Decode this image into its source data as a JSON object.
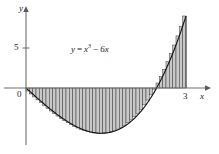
{
  "figure": {
    "title": "",
    "background_color": "#ffffff",
    "width": 219,
    "height": 154
  },
  "axes": {
    "x_axis_label": "x",
    "y_axis_label": "y",
    "origin_label": "0",
    "x_ticks": [
      {
        "value": 3,
        "label": "3"
      }
    ],
    "y_ticks": [
      {
        "value": 5,
        "label": "5"
      }
    ],
    "axis_color": "#6e6e6e",
    "label_color": "#1a1a1a"
  },
  "annotations": {
    "equation": {
      "lhs": "y",
      "equals": "=",
      "base": "x",
      "exponent": "3",
      "minus": "−",
      "term": "6x",
      "plain": "y = x³ − 6x"
    }
  },
  "chart_data": {
    "type": "area",
    "title": "",
    "subtitle": "",
    "xlabel": "x",
    "ylabel": "y",
    "function": "y = x^3 - 6x",
    "xlim": [
      -0.5,
      3.4
    ],
    "ylim": [
      -7.5,
      10.5
    ],
    "grid": false,
    "legend_position": "none",
    "annotations": [
      "y = x³ − 6x"
    ],
    "riemann_sum": {
      "method": "right-endpoint",
      "interval": [
        0,
        3
      ],
      "n_rectangles": 48,
      "fill_color": "#c8c8c8",
      "edge_color": "#222222",
      "signed": true
    },
    "curve_color": "#111111",
    "roots_shown": [
      0,
      2.449
    ],
    "local_minimum": {
      "x": 1.414,
      "y": -5.657
    },
    "endpoint_value": {
      "x": 3,
      "y": 9
    },
    "x": [
      0,
      0.25,
      0.5,
      0.75,
      1,
      1.25,
      1.5,
      1.75,
      2,
      2.25,
      2.449,
      2.5,
      2.75,
      3
    ],
    "y": [
      0,
      -1.484,
      -2.875,
      -4.078,
      -5,
      -5.547,
      -5.625,
      -5.141,
      -4,
      -2.109,
      0,
      -1.375,
      4.297,
      9
    ]
  }
}
